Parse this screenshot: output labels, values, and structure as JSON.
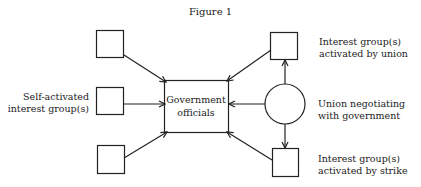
{
  "figure": {
    "title": "Figure 1"
  },
  "nodes": {
    "government": {
      "line1": "Government",
      "line2": "officials"
    },
    "self_activated": {
      "line1": "Self-activated",
      "line2": "interest group(s)"
    },
    "activated_by_union": {
      "line1": "Interest group(s)",
      "line2": "activated by union"
    },
    "union": {
      "line1": "Union negotiating",
      "line2": "with government"
    },
    "activated_by_strike": {
      "line1": "Interest group(s)",
      "line2": "activated by strike"
    }
  },
  "edges": [
    {
      "from": "top-left-box",
      "to": "government"
    },
    {
      "from": "self-activated-box",
      "to": "government"
    },
    {
      "from": "bottom-left-box",
      "to": "government"
    },
    {
      "from": "union-interest-box",
      "to": "government"
    },
    {
      "from": "union-circle",
      "to": "government"
    },
    {
      "from": "strike-interest-box",
      "to": "government"
    },
    {
      "from": "union-circle",
      "to": "union-interest-box"
    },
    {
      "from": "union-circle",
      "to": "strike-interest-box"
    }
  ]
}
